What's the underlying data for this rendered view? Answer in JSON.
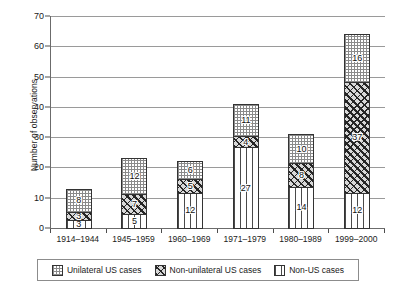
{
  "chart_data": {
    "type": "bar",
    "stacked": true,
    "title": "",
    "subtitle": "",
    "xlabel": "",
    "ylabel": "Number of observations",
    "ylim": [
      0,
      70
    ],
    "ytick_step": 10,
    "yticks": [
      0,
      10,
      20,
      30,
      40,
      50,
      60,
      70
    ],
    "grid": true,
    "grid_axis": "y",
    "legend_position": "bottom",
    "categories": [
      "1914–1944",
      "1945–1959",
      "1960–1969",
      "1971–1979",
      "1980–1989",
      "1999–2000"
    ],
    "series": [
      {
        "name": "Non-US cases",
        "pattern": "vertical-lines",
        "stack_order": 0,
        "values": [
          3,
          5,
          12,
          27,
          14,
          12
        ]
      },
      {
        "name": "Non-unilateral US cases",
        "pattern": "diagonal-hatch",
        "stack_order": 1,
        "values": [
          3,
          7,
          5,
          4,
          8,
          37
        ]
      },
      {
        "name": "Unilateral US cases",
        "pattern": "dotted-grid",
        "stack_order": 2,
        "values": [
          8,
          12,
          6,
          11,
          10,
          16
        ]
      }
    ],
    "totals": [
      14,
      24,
      23,
      42,
      32,
      65
    ],
    "data_labels_shown": true
  },
  "legend": {
    "items": [
      {
        "label": "Unilateral US cases",
        "pattern": "dotted-grid"
      },
      {
        "label": "Non-unilateral US cases",
        "pattern": "diagonal-hatch"
      },
      {
        "label": "Non-US cases",
        "pattern": "vertical-lines"
      }
    ]
  },
  "colors": {
    "background": "#ffffff",
    "gridline": "#9a9a9a",
    "axis": "#6b6b6b",
    "text": "#1a1a1a",
    "hatch_dark": "#262626",
    "line_mid": "#4a4a4a",
    "dot_light": "#8a8a8a"
  }
}
